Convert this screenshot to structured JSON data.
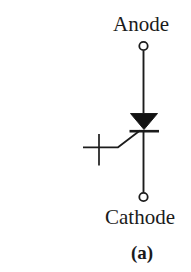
{
  "diagram": {
    "component": "thyristor-scr-symbol",
    "labels": {
      "anode": "Anode",
      "cathode": "Cathode",
      "caption": "(a)"
    },
    "colors": {
      "line": "#1c1c1c",
      "triangle_fill": "#121212",
      "background": "#ffffff"
    }
  }
}
